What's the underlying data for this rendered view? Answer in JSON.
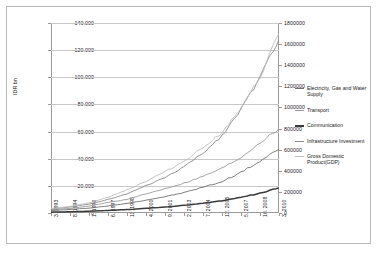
{
  "chart_data": {
    "type": "line",
    "title": "",
    "xlabel": "",
    "ylabel": "IDR bn",
    "ylabel_right": "",
    "ylim": [
      0,
      140000
    ],
    "ylim_right": [
      0,
      1800000
    ],
    "grid": true,
    "legend_position": "right",
    "y_ticks": [
      "0",
      "20.000",
      "40.000",
      "60.000",
      "80.000",
      "100.000",
      "120.000",
      "140.000"
    ],
    "y_ticks_right": [
      "0",
      "200000",
      "400000",
      "600000",
      "800000",
      "1000000",
      "1200000",
      "1400000",
      "1600000",
      "1800000"
    ],
    "categories": [
      "3. 1993",
      "8. 1994",
      "1. 1996",
      "6. 1997",
      "11. 1998",
      "4. 2000",
      "9. 2001",
      "2. 2003",
      "7. 2004",
      "12. 2005",
      "5. 2007",
      "10. 2008",
      "3. 2010"
    ],
    "x_tick_labels": [
      "3. 1993",
      "8. 1994",
      "1. 1996",
      "6. 1997",
      "11. 1998",
      "4. 2000",
      "9. 2001",
      "2. 2003",
      "7. 2004",
      "12. 2005",
      "5. 2007",
      "10. 2008",
      "3. 2010"
    ],
    "series": [
      {
        "name": "Electricity, Gas and Water Supply",
        "color": "#6f6f6f",
        "axis": "left",
        "values": [
          1800,
          2600,
          3600,
          5200,
          7000,
          9500,
          12000,
          15000,
          19000,
          23000,
          30000,
          38000,
          47000
        ]
      },
      {
        "name": "Transport",
        "color": "#9a9a9a",
        "axis": "left",
        "values": [
          2400,
          3400,
          5000,
          7800,
          10000,
          14000,
          18000,
          22000,
          27000,
          33000,
          41000,
          52000,
          62000
        ]
      },
      {
        "name": "Communication",
        "color": "#3b3b3b",
        "axis": "left",
        "values": [
          600,
          900,
          1300,
          1900,
          2500,
          3400,
          4400,
          5600,
          7200,
          9000,
          11500,
          14500,
          18500
        ]
      },
      {
        "name": "Infrastructure Investment",
        "color": "#8a8a8a",
        "axis": "left",
        "values": [
          3000,
          4400,
          6500,
          10000,
          14000,
          20000,
          26000,
          34000,
          44000,
          57000,
          76000,
          100000,
          128000
        ]
      },
      {
        "name": "Gross Domestic Product(GDP)",
        "color": "#bdbdbd",
        "axis": "right",
        "values": [
          42000,
          62000,
          95000,
          150000,
          220000,
          300000,
          390000,
          490000,
          620000,
          760000,
          980000,
          1280000,
          1700000
        ]
      }
    ],
    "legend": [
      "Electricity, Gas and Water Supply",
      "Transport",
      "Communication",
      "Infrastructure Investment",
      "Gross Domestic Product(GDP)"
    ]
  }
}
